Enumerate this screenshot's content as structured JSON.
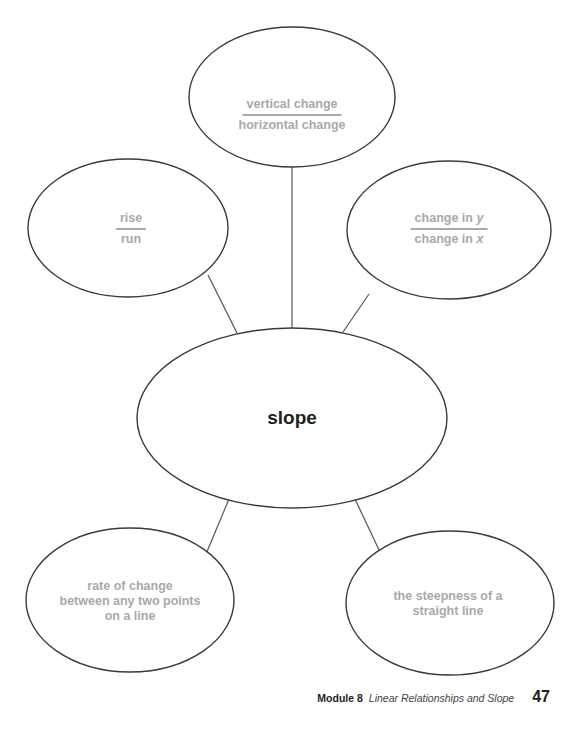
{
  "diagram": {
    "type": "concept-web",
    "center": {
      "label": "slope"
    },
    "nodes": {
      "top": {
        "numerator": "vertical change",
        "denominator": "horizontal change"
      },
      "left": {
        "numerator": "rise",
        "denominator": "run"
      },
      "right": {
        "numerator_text": "change in ",
        "numerator_var": "y",
        "denominator_text": "change in ",
        "denominator_var": "x"
      },
      "bottom_left": {
        "line1": "rate of change",
        "line2": "between any two points",
        "line3": "on a line"
      },
      "bottom_right": {
        "line1": "the steepness of a",
        "line2": "straight line"
      }
    },
    "colors": {
      "outline": "#3a3a3a",
      "answer_text": "#a9a9a9",
      "center_text": "#231f20"
    }
  },
  "footer": {
    "module": "Module 8",
    "title": "Linear Relationships and Slope",
    "page_number": "47"
  }
}
